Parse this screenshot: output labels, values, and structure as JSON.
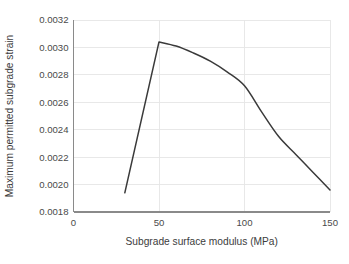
{
  "chart_data": {
    "type": "line",
    "title": "",
    "xlabel": "Subgrade surface modulus (MPa)",
    "ylabel": "Maximum permitted subgrade strain",
    "xlim": [
      0,
      150
    ],
    "ylim": [
      0.0018,
      0.0032
    ],
    "grid": true,
    "legend": "none",
    "xticks": [
      0,
      50,
      100,
      150
    ],
    "xtick_labels": [
      "0",
      "50",
      "100",
      "150"
    ],
    "yticks": [
      0.0018,
      0.002,
      0.0022,
      0.0024,
      0.0026,
      0.0028,
      0.003,
      0.0032
    ],
    "ytick_labels": [
      "0.0018",
      "0.0020",
      "0.0022",
      "0.0024",
      "0.0026",
      "0.0028",
      "0.0030",
      "0.0032"
    ],
    "series": [
      {
        "name": "Maximum permitted subgrade strain",
        "color": "#3a3a3a",
        "x": [
          30,
          50,
          60,
          70,
          80,
          90,
          100,
          110,
          120,
          130,
          140,
          150
        ],
        "values": [
          0.00194,
          0.00304,
          0.00301,
          0.00296,
          0.0029,
          0.00282,
          0.00272,
          0.00253,
          0.00235,
          0.00222,
          0.00209,
          0.00196
        ]
      }
    ]
  },
  "axes": {
    "x_title": "Subgrade surface modulus (MPa)",
    "y_title": "Maximum permitted subgrade strain"
  },
  "colors": {
    "line": "#3a3a3a",
    "grid": "#e6e6e6",
    "spine": "#8a8a8a",
    "background": "#ffffff",
    "text": "#3c3c3c"
  }
}
